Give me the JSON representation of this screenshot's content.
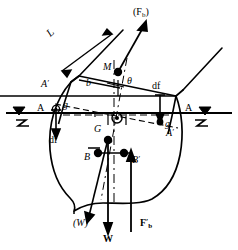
{
  "figure": {
    "kind": "naval-architecture-stability-diagram",
    "stroke_color": "#000000",
    "background_color": "#ffffff"
  },
  "labels": {
    "mast_length": "L",
    "buoyancy_force_inclined": "(F",
    "buoyancy_force_inclined_sub": "b",
    "buoyancy_force_inclined_close": ")",
    "metacentre": "M",
    "heel_angle": "θ",
    "righting_arm": "b",
    "df_left": "df",
    "df_right": "df",
    "g_left": "g",
    "g_right": "g",
    "waterline_left": "A",
    "waterline_right": "A",
    "heeled_waterline_left": "A",
    "heeled_waterline_left_prime": "′",
    "heeled_waterline_right": "A",
    "heeled_waterline_right_prime": "′",
    "centre_of_gravity": "G",
    "centre_of_buoyancy": "B",
    "centre_of_buoyancy_heeled": "B",
    "centre_of_buoyancy_heeled_prime": "′",
    "weight_inclined": "(W)",
    "weight_vertical": "W",
    "buoyancy_vertical": "F",
    "buoyancy_vertical_prime": "′",
    "buoyancy_vertical_sub": "b"
  },
  "points": {
    "M": {
      "x": 118,
      "y": 72,
      "marker": "filled-dot"
    },
    "G": {
      "x": 108,
      "y": 140,
      "marker": "filled-dot"
    },
    "B": {
      "x": 98,
      "y": 153,
      "marker": "filled-dot"
    },
    "Bprime": {
      "x": 124,
      "y": 153,
      "marker": "filled-dot"
    },
    "O": {
      "x": 118,
      "y": 119,
      "marker": "circled-dot"
    },
    "g_left": {
      "x": 56,
      "y": 110,
      "marker": "circled-dot"
    },
    "g_right": {
      "x": 160,
      "y": 122,
      "marker": "filled-dot"
    }
  },
  "vectors": {
    "Fb_inclined": {
      "from": [
        118,
        72
      ],
      "to": [
        145,
        22
      ],
      "head": "arrow"
    },
    "W_inclined": {
      "from": [
        108,
        140
      ],
      "to": [
        88,
        220
      ],
      "head": "arrow"
    },
    "W_vertical": {
      "from": [
        108,
        140
      ],
      "to": [
        108,
        232
      ],
      "head": "arrow"
    },
    "Fb_vertical": {
      "from": [
        131,
        232
      ],
      "to": [
        131,
        151
      ],
      "head": "arrow"
    },
    "df_left": {
      "from": [
        56,
        110
      ],
      "to": [
        56,
        136
      ],
      "head": "arrow"
    },
    "df_right": {
      "from": [
        160,
        95
      ],
      "to": [
        160,
        120
      ],
      "head": "arrow"
    }
  },
  "water_symbols": {
    "left": {
      "x": 18,
      "y": 113,
      "glyph": "triangle-with-squiggle"
    },
    "right": {
      "x": 205,
      "y": 113,
      "glyph": "triangle-with-squiggle"
    }
  }
}
